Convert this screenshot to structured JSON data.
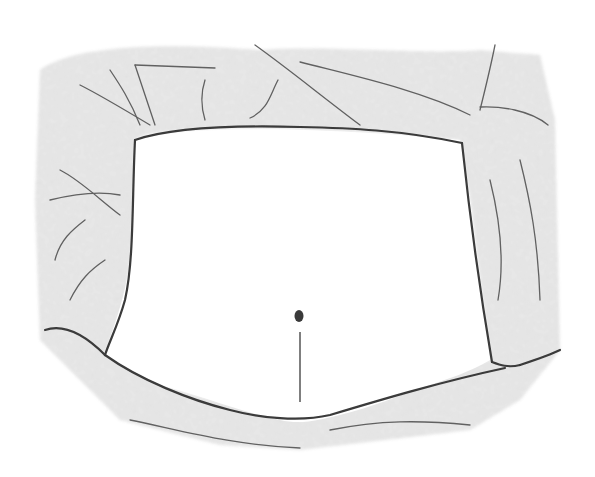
{
  "image": {
    "subject": "pencil sketch of a torso-like frame with navel and midline",
    "colors": {
      "background": "#ffffff",
      "shading": "#9a9a9a",
      "line": "#3a3a3a"
    }
  }
}
